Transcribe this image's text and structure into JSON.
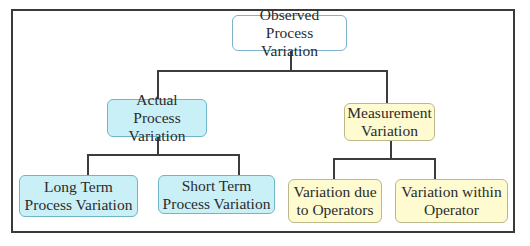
{
  "diagram": {
    "type": "hierarchy-tree",
    "root": {
      "label": "Observed Process\nVariation"
    },
    "level1": [
      {
        "label": "Actual Process\nVariation",
        "color": "#c9f0f7"
      },
      {
        "label": "Measurement\nVariation",
        "color": "#fdfbcf"
      }
    ],
    "level2_actual": [
      {
        "label": "Long Term\nProcess Variation",
        "color": "#c9f0f7"
      },
      {
        "label": "Short Term\nProcess Variation",
        "color": "#c9f0f7"
      }
    ],
    "level2_measurement": [
      {
        "label": "Variation due\nto Operators",
        "color": "#fdfbcf"
      },
      {
        "label": "Variation within\nOperator",
        "color": "#fdfbcf"
      }
    ]
  }
}
